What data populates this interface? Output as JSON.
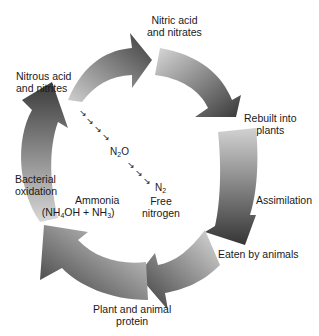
{
  "labels": {
    "nitric": [
      "Nitric acid",
      "and nitrates"
    ],
    "rebuilt": [
      "Rebuilt into",
      "plants"
    ],
    "assimilation": "Assimilation",
    "eaten": "Eaten by animals",
    "protein": [
      "Plant and animal",
      "protein"
    ],
    "ammonia": "Ammonia",
    "ammonia_formula": {
      "a": "(NH",
      "s1": "4",
      "b": "OH + NH",
      "s2": "3",
      "c": ")"
    },
    "bacterial": [
      "Bacterial",
      "oxidation"
    ],
    "nitrous": [
      "Nitrous acid",
      "and nitrites"
    ],
    "n2o": {
      "a": "N",
      "s": "2",
      "b": "O"
    },
    "n2": {
      "a": "N",
      "s": "2"
    },
    "free_nitrogen": [
      "Free",
      "nitrogen"
    ]
  },
  "escape_symbol": "↘",
  "colors": {
    "arrow_dark": "#3a3a3a",
    "arrow_light": "#d6d6d6",
    "text": "#1a1a1a"
  }
}
